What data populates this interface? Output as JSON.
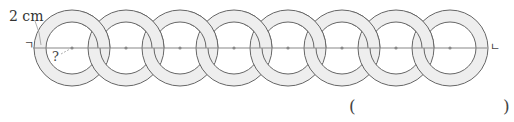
{
  "labels": {
    "dimension": "2 cm",
    "unknown": "?",
    "point_a": "ㄱ",
    "point_b": "ㄴ"
  },
  "answer": {
    "open": "(",
    "close": ")",
    "value": ""
  },
  "figure": {
    "ring_count": 8,
    "centers_x": [
      72,
      126,
      180,
      234,
      288,
      342,
      396,
      450
    ],
    "center_y": 48,
    "outer_radius": 38,
    "inner_radius": 26,
    "ring_thickness_label": "2 cm",
    "colors": {
      "band_fill": "#eeeeee",
      "outline": "#666666",
      "axis_line": "#888888",
      "center_dot": "#888888"
    }
  }
}
